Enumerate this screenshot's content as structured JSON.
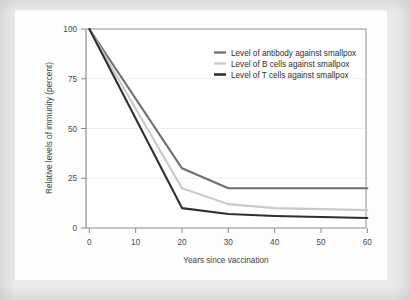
{
  "chart_data": {
    "type": "line",
    "title": "",
    "xlabel": "Years since vaccination",
    "ylabel": "Relative levels of immunity (percent)",
    "xlim": [
      0,
      60
    ],
    "ylim": [
      0,
      100
    ],
    "xticks": [
      0,
      10,
      20,
      30,
      40,
      50,
      60
    ],
    "yticks": [
      0,
      25,
      50,
      75,
      100
    ],
    "grid": "horizontal",
    "legend_position": "top-right",
    "x": [
      0,
      20,
      30,
      40,
      50,
      60
    ],
    "series": [
      {
        "name": "Level of antibody against smallpox",
        "color": "#6f6f6f",
        "values": [
          100,
          30,
          20,
          20,
          20,
          20
        ]
      },
      {
        "name": "Level of B cells against smallpox",
        "color": "#c9c9c9",
        "values": [
          100,
          20,
          12,
          10,
          9.5,
          9
        ]
      },
      {
        "name": "Level of T cells against smallpox",
        "color": "#2f2f2f",
        "values": [
          100,
          10,
          7,
          6,
          5.5,
          5
        ]
      }
    ]
  },
  "axes": {
    "x": {
      "title": "Years since vaccination",
      "tick_labels": [
        "0",
        "10",
        "20",
        "30",
        "40",
        "50",
        "60"
      ]
    },
    "y": {
      "title": "Relative levels of immunity (percent)",
      "tick_labels": [
        "0",
        "25",
        "50",
        "75",
        "100"
      ]
    }
  },
  "legend": {
    "entries": [
      {
        "label": "Level of antibody against smallpox",
        "color": "#6f6f6f",
        "swatch": "line-swatch-antibody"
      },
      {
        "label": "Level of B cells against smallpox",
        "color": "#c9c9c9",
        "swatch": "line-swatch-bcells"
      },
      {
        "label": "Level of T cells against smallpox",
        "color": "#2f2f2f",
        "swatch": "line-swatch-tcells"
      }
    ]
  },
  "colors": {
    "page_background": "#eaeaea",
    "card_background": "#fdfdfd",
    "axis": "#777777",
    "gridline": "#e4e4e4",
    "text": "#3f3f3f"
  }
}
